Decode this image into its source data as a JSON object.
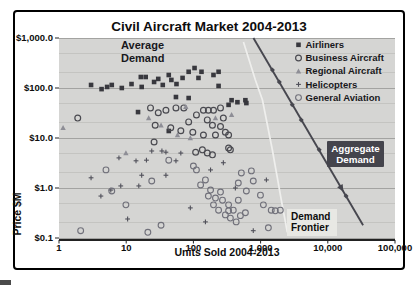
{
  "colors": {
    "plot_bg": "#d5d5d3",
    "grid_major": "#a3a3a1",
    "grid_minor": "#bfbfbd",
    "axis_line": "#222222",
    "text": "#0d0d0d",
    "airliners": "#38383e",
    "business": "#4a4a50",
    "regional": "#8e8e96",
    "helicopters": "#50505a",
    "general_aviation": "#70707a",
    "aggregate_line": "#47474f",
    "frontier_line": "#efefed",
    "badge_bg": "#44444c",
    "badge_text": "#ffffff",
    "frontier_label_bg": "#e8e8e4"
  },
  "chart_data": {
    "type": "scatter",
    "title": "Civil Aircraft Market 2004-2013",
    "xlabel": "Units Sold 2004-2013",
    "ylabel": "Price $M",
    "x_scale": "log",
    "y_scale": "log",
    "xlim": [
      1,
      100000
    ],
    "ylim": [
      0.1,
      1000
    ],
    "grid": "horizontal only",
    "legend_position": "top-right inside plot",
    "x_ticks": [
      {
        "value": 1,
        "label": "1"
      },
      {
        "value": 10,
        "label": "10"
      },
      {
        "value": 100,
        "label": "100"
      },
      {
        "value": 1000,
        "label": "1,000"
      },
      {
        "value": 10000,
        "label": "10,000"
      },
      {
        "value": 100000,
        "label": "100,000"
      }
    ],
    "y_ticks": [
      {
        "value": 1000,
        "label": "$1,000.0"
      },
      {
        "value": 100,
        "label": "$100.0"
      },
      {
        "value": 10,
        "label": "$10.0"
      },
      {
        "value": 1,
        "label": "$1.0"
      },
      {
        "value": 0.1,
        "label": "$0.1"
      }
    ],
    "y_gridlines_minor": [
      500,
      200,
      50,
      20,
      5,
      2,
      0.5,
      0.2
    ],
    "legend": {
      "entries": [
        {
          "label": "Airliners",
          "marker": "square"
        },
        {
          "label": "Business Aircraft",
          "marker": "circle"
        },
        {
          "label": "Regional Aircraft",
          "marker": "triangle"
        },
        {
          "label": "Helicopters",
          "marker": "plus"
        },
        {
          "label": "General Aviation",
          "marker": "circle-light"
        }
      ]
    },
    "series": [
      {
        "name": "Airliners",
        "marker": "square",
        "color_key": "airliners",
        "points": [
          [
            3.0,
            115
          ],
          [
            4.3,
            95
          ],
          [
            5.2,
            105
          ],
          [
            6.1,
            115
          ],
          [
            8.6,
            100
          ],
          [
            12,
            120
          ],
          [
            15,
            33
          ],
          [
            16.5,
            166
          ],
          [
            17,
            105
          ],
          [
            19.5,
            166
          ],
          [
            26,
            132
          ],
          [
            30,
            152
          ],
          [
            35,
            115
          ],
          [
            43,
            182
          ],
          [
            43,
            13.8
          ],
          [
            47,
            145
          ],
          [
            55,
            66
          ],
          [
            56,
            120
          ],
          [
            69,
            159
          ],
          [
            85,
            211
          ],
          [
            85,
            63
          ],
          [
            104,
            251
          ],
          [
            119,
            159
          ],
          [
            132,
            211
          ],
          [
            199,
            182
          ],
          [
            237,
            211
          ],
          [
            237,
            110
          ],
          [
            334,
            46
          ],
          [
            370,
            57
          ],
          [
            452,
            52
          ],
          [
            594,
            57
          ],
          [
            614,
            50
          ]
        ]
      },
      {
        "name": "Business Aircraft",
        "marker": "circle",
        "color_key": "business",
        "points": [
          [
            1.9,
            25
          ],
          [
            23,
            40
          ],
          [
            26,
            8.3
          ],
          [
            27,
            18
          ],
          [
            30,
            32
          ],
          [
            39,
            36
          ],
          [
            46,
            16
          ],
          [
            55,
            40
          ],
          [
            65,
            14
          ],
          [
            72,
            40
          ],
          [
            85,
            21
          ],
          [
            98,
            13
          ],
          [
            108,
            5.2
          ],
          [
            111,
            29
          ],
          [
            136,
            5.8
          ],
          [
            141,
            36
          ],
          [
            141,
            11.5
          ],
          [
            161,
            23
          ],
          [
            161,
            5.0
          ],
          [
            167,
            36
          ],
          [
            192,
            18
          ],
          [
            192,
            4.6
          ],
          [
            199,
            36
          ],
          [
            213,
            11.5
          ],
          [
            253,
            40
          ],
          [
            253,
            17
          ],
          [
            279,
            25
          ],
          [
            299,
            13
          ],
          [
            334,
            11.5
          ],
          [
            334,
            6.3
          ],
          [
            355,
            5.8
          ]
        ]
      },
      {
        "name": "Regional Aircraft",
        "marker": "triangle",
        "color_key": "regional",
        "points": [
          [
            1.15,
            16
          ],
          [
            9.9,
            5.0
          ],
          [
            21.6,
            25
          ],
          [
            33,
            18
          ],
          [
            58,
            11.5
          ],
          [
            77,
            42
          ],
          [
            90,
            10
          ],
          [
            213,
            25
          ],
          [
            370,
            29
          ]
        ]
      },
      {
        "name": "Helicopters",
        "marker": "plus",
        "color_key": "helicopters",
        "points": [
          [
            3.0,
            1.6
          ],
          [
            4.2,
            0.69
          ],
          [
            5.9,
            0.91
          ],
          [
            7.8,
            4.0
          ],
          [
            8.3,
            1.1
          ],
          [
            10.5,
            0.24
          ],
          [
            14,
            3.5
          ],
          [
            15.4,
            1.1
          ],
          [
            17,
            1.8
          ],
          [
            20,
            3.6
          ],
          [
            24,
            5.5
          ],
          [
            34,
            5.5
          ],
          [
            39,
            1.8
          ],
          [
            39,
            5.2
          ],
          [
            55,
            3.5
          ],
          [
            65,
            5.0
          ],
          [
            90,
            0.4
          ],
          [
            151,
            0.21
          ],
          [
            180,
            2.3
          ],
          [
            279,
            3.2
          ],
          [
            421,
            1.0
          ],
          [
            778,
            0.14
          ],
          [
            1219,
            1.45
          ]
        ]
      },
      {
        "name": "General Aviation",
        "marker": "circle-light",
        "color_key": "general_aviation",
        "points": [
          [
            2.1,
            0.14
          ],
          [
            5.0,
            2.3
          ],
          [
            6.1,
            0.87
          ],
          [
            9.9,
            0.46
          ],
          [
            21,
            0.13
          ],
          [
            24,
            1.38
          ],
          [
            33,
            0.18
          ],
          [
            43,
            3.6
          ],
          [
            100,
            2.75
          ],
          [
            111,
            2.3
          ],
          [
            128,
            1.15
          ],
          [
            151,
            1.45
          ],
          [
            167,
            0.69
          ],
          [
            180,
            0.91
          ],
          [
            199,
            0.46
          ],
          [
            213,
            0.63
          ],
          [
            237,
            0.36
          ],
          [
            253,
            0.83
          ],
          [
            271,
            0.57
          ],
          [
            299,
            0.29
          ],
          [
            334,
            0.46
          ],
          [
            334,
            0.35
          ],
          [
            355,
            0.25
          ],
          [
            392,
            0.36
          ],
          [
            433,
            0.21
          ],
          [
            466,
            0.57
          ],
          [
            466,
            1.26
          ],
          [
            500,
            0.28
          ],
          [
            517,
            2.0
          ],
          [
            594,
            0.32
          ],
          [
            614,
            0.87
          ],
          [
            729,
            2.2
          ],
          [
            778,
            1.38
          ],
          [
            995,
            0.72
          ],
          [
            1100,
            0.46
          ],
          [
            1305,
            0.16
          ],
          [
            1440,
            0.36
          ],
          [
            1654,
            0.35
          ],
          [
            1965,
            0.36
          ]
        ]
      }
    ],
    "lines": {
      "aggregate_demand": {
        "name": "Aggregate Demand",
        "endpoints": [
          [
            782,
            1000
          ],
          [
            33500,
            0.18
          ]
        ],
        "markers": [
          [
            1500,
            229
          ],
          [
            1900,
            132
          ],
          [
            2960,
            46
          ],
          [
            4030,
            23
          ],
          [
            7450,
            5.8
          ],
          [
            18700,
            0.69
          ]
        ],
        "has_arrow": true
      },
      "demand_frontier": {
        "name": "Demand Frontier",
        "points": [
          [
            556,
            832
          ],
          [
            836,
            145
          ],
          [
            1066,
            57.5
          ],
          [
            1497,
            5.75
          ],
          [
            2033,
            0.575
          ],
          [
            2499,
            0.13
          ]
        ]
      }
    },
    "annotations": {
      "average_demand": {
        "line1": "Average",
        "line2": "Demand"
      },
      "aggregate_badge": {
        "line1": "Aggregate",
        "line2": "Demand"
      },
      "demand_frontier": {
        "line1": "Demand",
        "line2": "Frontier"
      }
    }
  }
}
